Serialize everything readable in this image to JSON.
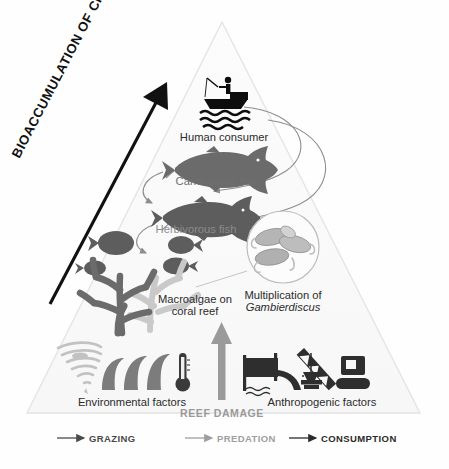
{
  "figure": {
    "title_axis": "BIOACCUMULATION OF CIGUATOXINS",
    "shape": "pyramid",
    "background_color": "#fefefe",
    "pyramid_fill": "#fafafa",
    "pyramid_stroke": "#e2e2e2"
  },
  "levels": [
    {
      "id": "human-consumer",
      "label": "Human consumer",
      "icon": "fisherman-in-boat-icon",
      "icon_color": "#0d0d0d",
      "tier": 4
    },
    {
      "id": "carnivorous-fish",
      "label": "Carnivorous fish",
      "icon": "carnivorous-fish-icon",
      "icon_color": "#6b6b6b",
      "tier": 3
    },
    {
      "id": "herbivorous-fish",
      "label": "Herbivorous fish",
      "icon": "herbivorous-fish-icon",
      "icon_color": "#5d5d5d",
      "tier": 2
    },
    {
      "id": "macroalgae",
      "label_line1": "Macroalgae on",
      "label_line2": "coral reef",
      "icon": "coral-reef-icon",
      "icon_color": "#6b6b6b",
      "icon_color_secondary": "#c9c9c9",
      "tier": 1
    }
  ],
  "inset": {
    "id": "gambierdiscus",
    "label_line1": "Multiplication of",
    "label_line2": "Gambierdiscus",
    "label_line2_italic": true,
    "icon": "dinoflagellate-cells-icon",
    "circle_stroke": "#bdbdbd",
    "cell_color": "#b5b5b5"
  },
  "drivers": {
    "environmental": {
      "label": "Environmental factors",
      "icons": [
        "cyclone-icon",
        "waves-icon",
        "thermometer-icon"
      ],
      "cyclone_color": "#c2c2c2",
      "waves_color": "#7c7c7c",
      "thermometer_color": "#3a3a3a"
    },
    "anthropogenic": {
      "label": "Anthropogenic factors",
      "icons": [
        "wastewater-outflow-icon",
        "construction-crane-icon"
      ],
      "color": "#2e2e2e"
    },
    "reef_damage": {
      "label": "REEF DAMAGE",
      "arrow": "up-arrow-icon",
      "color": "#9a9a9a"
    }
  },
  "legend": [
    {
      "id": "grazing",
      "label": "GRAZING",
      "color": "#4a4a4a"
    },
    {
      "id": "predation",
      "label": "PREDATION",
      "color": "#9e9e9e"
    },
    {
      "id": "consumption",
      "label": "CONSUMPTION",
      "color": "#2b2b2b"
    }
  ]
}
